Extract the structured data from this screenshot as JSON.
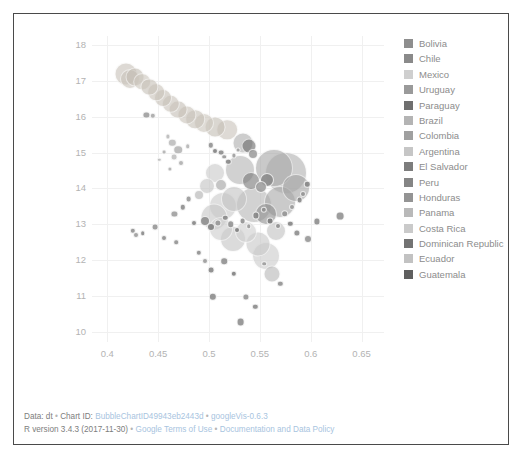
{
  "chart_data": {
    "type": "scatter",
    "title": "",
    "xlabel": "",
    "ylabel": "",
    "xlim": [
      0.385,
      0.672
    ],
    "ylim": [
      9.72,
      18.25
    ],
    "xticks": [
      "0.4",
      "0.45",
      "0.5",
      "0.55",
      "0.6",
      "0.65"
    ],
    "xtick_values": [
      0.4,
      0.45,
      0.5,
      0.55,
      0.6,
      0.65
    ],
    "yticks": [
      "10",
      "11",
      "12",
      "13",
      "14",
      "15",
      "16",
      "17",
      "18"
    ],
    "ytick_values": [
      10,
      11,
      12,
      13,
      14,
      15,
      16,
      17,
      18
    ],
    "grid": true,
    "legend_position": "right",
    "note": "googleVis bubble chart; bubble area encodes a third variable, color encodes country",
    "series": [
      {
        "name": "Bolivia",
        "color": "#8e8e8e"
      },
      {
        "name": "Chile",
        "color": "#8a8a8a"
      },
      {
        "name": "Mexico",
        "color": "#cfcfcf"
      },
      {
        "name": "Uruguay",
        "color": "#9a9a9a"
      },
      {
        "name": "Paraguay",
        "color": "#6f6f6f"
      },
      {
        "name": "Brazil",
        "color": "#b4b4b4"
      },
      {
        "name": "Colombia",
        "color": "#a0a0a0"
      },
      {
        "name": "Argentina",
        "color": "#c6c6c6"
      },
      {
        "name": "El Salvador",
        "color": "#7d7d7d"
      },
      {
        "name": "Peru",
        "color": "#858585"
      },
      {
        "name": "Honduras",
        "color": "#949494"
      },
      {
        "name": "Panama",
        "color": "#b9b9b9"
      },
      {
        "name": "Costa Rica",
        "color": "#cacaca"
      },
      {
        "name": "Dominican Republic",
        "color": "#737373"
      },
      {
        "name": "Ecuador",
        "color": "#c2c2c2"
      },
      {
        "name": "Guatemala",
        "color": "#5f5f5f"
      }
    ],
    "points": [
      {
        "x": 0.4185,
        "y": 17.18,
        "r": 11.5,
        "c": "#c9c3ba"
      },
      {
        "x": 0.4225,
        "y": 17.05,
        "r": 10.0,
        "c": "#cbc5bc"
      },
      {
        "x": 0.4275,
        "y": 17.12,
        "r": 9.5,
        "c": "#c5bfb6"
      },
      {
        "x": 0.4345,
        "y": 16.98,
        "r": 8.8,
        "c": "#cdc7be"
      },
      {
        "x": 0.4415,
        "y": 16.84,
        "r": 8.6,
        "c": "#c8c2b9"
      },
      {
        "x": 0.448,
        "y": 16.69,
        "r": 8.8,
        "c": "#cac4bb"
      },
      {
        "x": 0.455,
        "y": 16.52,
        "r": 9.0,
        "c": "#c7c1b8"
      },
      {
        "x": 0.4625,
        "y": 16.36,
        "r": 9.2,
        "c": "#cbc5bc"
      },
      {
        "x": 0.47,
        "y": 16.2,
        "r": 9.4,
        "c": "#c6c0b7"
      },
      {
        "x": 0.478,
        "y": 16.06,
        "r": 9.6,
        "c": "#cac4bb"
      },
      {
        "x": 0.4865,
        "y": 15.93,
        "r": 9.8,
        "c": "#c8c2b9"
      },
      {
        "x": 0.4955,
        "y": 15.82,
        "r": 10.0,
        "c": "#cdc7be"
      },
      {
        "x": 0.506,
        "y": 15.72,
        "r": 10.4,
        "c": "#c5bfb6"
      },
      {
        "x": 0.518,
        "y": 15.64,
        "r": 10.8,
        "c": "#cbc5bc"
      },
      {
        "x": 0.4385,
        "y": 16.05,
        "r": 3.6,
        "c": "#9c9c9c"
      },
      {
        "x": 0.445,
        "y": 16.02,
        "r": 3.2,
        "c": "#a7a7a7"
      },
      {
        "x": 0.4595,
        "y": 15.45,
        "r": 2.6,
        "c": "#b9b9b9"
      },
      {
        "x": 0.464,
        "y": 15.28,
        "r": 4.2,
        "c": "#bdbdbd"
      },
      {
        "x": 0.47,
        "y": 15.08,
        "r": 4.8,
        "c": "#b5b5b5"
      },
      {
        "x": 0.4655,
        "y": 14.88,
        "r": 3.4,
        "c": "#c0c0c0"
      },
      {
        "x": 0.472,
        "y": 14.7,
        "r": 3.0,
        "c": "#aeaeae"
      },
      {
        "x": 0.479,
        "y": 15.18,
        "r": 2.8,
        "c": "#b3b3b3"
      },
      {
        "x": 0.502,
        "y": 15.2,
        "r": 3.2,
        "c": "#8f8f8f"
      },
      {
        "x": 0.506,
        "y": 15.05,
        "r": 3.0,
        "c": "#7e7e7e"
      },
      {
        "x": 0.5115,
        "y": 15.0,
        "r": 3.4,
        "c": "#8a8a8a"
      },
      {
        "x": 0.515,
        "y": 14.88,
        "r": 2.8,
        "c": "#959595"
      },
      {
        "x": 0.519,
        "y": 14.74,
        "r": 3.2,
        "c": "#848484"
      },
      {
        "x": 0.5245,
        "y": 14.92,
        "r": 2.6,
        "c": "#9b9b9b"
      },
      {
        "x": 0.5285,
        "y": 15.08,
        "r": 2.4,
        "c": "#a2a2a2"
      },
      {
        "x": 0.533,
        "y": 15.26,
        "r": 10.5,
        "c": "#b0b0b0"
      },
      {
        "x": 0.539,
        "y": 15.18,
        "r": 7.5,
        "c": "#6e6e6e"
      },
      {
        "x": 0.543,
        "y": 14.96,
        "r": 5.0,
        "c": "#9e9e9e"
      },
      {
        "x": 0.53,
        "y": 14.52,
        "r": 15.0,
        "c": "#b6b6b6"
      },
      {
        "x": 0.5415,
        "y": 14.2,
        "r": 9.0,
        "c": "#7a7a7a"
      },
      {
        "x": 0.551,
        "y": 14.05,
        "r": 6.0,
        "c": "#9d9d9d"
      },
      {
        "x": 0.557,
        "y": 14.24,
        "r": 7.0,
        "c": "#8b8b8b"
      },
      {
        "x": 0.564,
        "y": 14.58,
        "r": 19.0,
        "c": "#a9a9a9"
      },
      {
        "x": 0.576,
        "y": 14.42,
        "r": 21.0,
        "c": "#b2b2b2"
      },
      {
        "x": 0.5855,
        "y": 14.0,
        "r": 14.0,
        "c": "#a5a5a5"
      },
      {
        "x": 0.544,
        "y": 13.55,
        "r": 18.0,
        "c": "#b8b8b8"
      },
      {
        "x": 0.556,
        "y": 13.28,
        "r": 11.0,
        "c": "#909090"
      },
      {
        "x": 0.57,
        "y": 13.62,
        "r": 16.0,
        "c": "#aaaaaa"
      },
      {
        "x": 0.525,
        "y": 13.72,
        "r": 13.0,
        "c": "#c4c4c4"
      },
      {
        "x": 0.5135,
        "y": 13.52,
        "r": 14.0,
        "c": "#cbcbcb"
      },
      {
        "x": 0.5045,
        "y": 13.2,
        "r": 13.5,
        "c": "#c8c8c8"
      },
      {
        "x": 0.5115,
        "y": 12.88,
        "r": 12.0,
        "c": "#cecece"
      },
      {
        "x": 0.524,
        "y": 12.6,
        "r": 13.0,
        "c": "#c6c6c6"
      },
      {
        "x": 0.536,
        "y": 12.8,
        "r": 11.0,
        "c": "#d0d0d0"
      },
      {
        "x": 0.548,
        "y": 12.45,
        "r": 12.5,
        "c": "#c9c9c9"
      },
      {
        "x": 0.556,
        "y": 12.12,
        "r": 14.0,
        "c": "#cdcdcd"
      },
      {
        "x": 0.566,
        "y": 12.82,
        "r": 10.0,
        "c": "#c3c3c3"
      },
      {
        "x": 0.4965,
        "y": 13.08,
        "r": 5.0,
        "c": "#8d8d8d"
      },
      {
        "x": 0.502,
        "y": 12.92,
        "r": 4.0,
        "c": "#7f7f7f"
      },
      {
        "x": 0.509,
        "y": 13.05,
        "r": 3.6,
        "c": "#979797"
      },
      {
        "x": 0.516,
        "y": 13.18,
        "r": 3.2,
        "c": "#888888"
      },
      {
        "x": 0.5215,
        "y": 13.0,
        "r": 3.8,
        "c": "#929292"
      },
      {
        "x": 0.5275,
        "y": 12.84,
        "r": 3.0,
        "c": "#7c7c7c"
      },
      {
        "x": 0.533,
        "y": 13.1,
        "r": 3.4,
        "c": "#8e8e8e"
      },
      {
        "x": 0.539,
        "y": 12.95,
        "r": 2.8,
        "c": "#999999"
      },
      {
        "x": 0.546,
        "y": 13.25,
        "r": 3.6,
        "c": "#858585"
      },
      {
        "x": 0.554,
        "y": 13.4,
        "r": 3.2,
        "c": "#909090"
      },
      {
        "x": 0.56,
        "y": 13.08,
        "r": 3.4,
        "c": "#7b7b7b"
      },
      {
        "x": 0.568,
        "y": 12.95,
        "r": 3.0,
        "c": "#8c8c8c"
      },
      {
        "x": 0.5745,
        "y": 13.3,
        "r": 3.8,
        "c": "#959595"
      },
      {
        "x": 0.58,
        "y": 13.02,
        "r": 3.2,
        "c": "#818181"
      },
      {
        "x": 0.586,
        "y": 12.75,
        "r": 3.6,
        "c": "#8a8a8a"
      },
      {
        "x": 0.582,
        "y": 13.48,
        "r": 3.0,
        "c": "#9a9a9a"
      },
      {
        "x": 0.589,
        "y": 13.68,
        "r": 3.4,
        "c": "#878787"
      },
      {
        "x": 0.425,
        "y": 12.82,
        "r": 3.2,
        "c": "#8f8f8f"
      },
      {
        "x": 0.4285,
        "y": 12.7,
        "r": 3.0,
        "c": "#9a9a9a"
      },
      {
        "x": 0.435,
        "y": 12.76,
        "r": 2.8,
        "c": "#868686"
      },
      {
        "x": 0.447,
        "y": 12.92,
        "r": 3.4,
        "c": "#939393"
      },
      {
        "x": 0.456,
        "y": 12.62,
        "r": 3.0,
        "c": "#8b8b8b"
      },
      {
        "x": 0.466,
        "y": 13.3,
        "r": 3.6,
        "c": "#9d9d9d"
      },
      {
        "x": 0.4745,
        "y": 13.48,
        "r": 3.2,
        "c": "#8a8a8a"
      },
      {
        "x": 0.48,
        "y": 13.7,
        "r": 3.4,
        "c": "#979797"
      },
      {
        "x": 0.4855,
        "y": 13.05,
        "r": 3.0,
        "c": "#828282"
      },
      {
        "x": 0.468,
        "y": 12.5,
        "r": 2.8,
        "c": "#909090"
      },
      {
        "x": 0.49,
        "y": 12.2,
        "r": 3.2,
        "c": "#8d8d8d"
      },
      {
        "x": 0.496,
        "y": 11.98,
        "r": 3.0,
        "c": "#999999"
      },
      {
        "x": 0.502,
        "y": 11.72,
        "r": 3.4,
        "c": "#858585"
      },
      {
        "x": 0.515,
        "y": 11.98,
        "r": 3.8,
        "c": "#8e8e8e"
      },
      {
        "x": 0.5245,
        "y": 11.62,
        "r": 3.2,
        "c": "#7d7d7d"
      },
      {
        "x": 0.504,
        "y": 10.98,
        "r": 4.2,
        "c": "#8a8a8a"
      },
      {
        "x": 0.536,
        "y": 10.98,
        "r": 3.6,
        "c": "#929292"
      },
      {
        "x": 0.5455,
        "y": 10.7,
        "r": 3.2,
        "c": "#888888"
      },
      {
        "x": 0.531,
        "y": 10.28,
        "r": 4.4,
        "c": "#8d8d8d"
      },
      {
        "x": 0.562,
        "y": 11.62,
        "r": 8.5,
        "c": "#b9b9b9"
      },
      {
        "x": 0.57,
        "y": 11.35,
        "r": 3.2,
        "c": "#8f8f8f"
      },
      {
        "x": 0.5545,
        "y": 11.9,
        "r": 2.8,
        "c": "#9b9b9b"
      },
      {
        "x": 0.597,
        "y": 12.6,
        "r": 4.0,
        "c": "#959595"
      },
      {
        "x": 0.606,
        "y": 13.08,
        "r": 3.6,
        "c": "#8a8a8a"
      },
      {
        "x": 0.629,
        "y": 13.22,
        "r": 4.4,
        "c": "#909090"
      },
      {
        "x": 0.5965,
        "y": 14.12,
        "r": 3.2,
        "c": "#868686"
      },
      {
        "x": 0.592,
        "y": 13.85,
        "r": 3.0,
        "c": "#939393"
      },
      {
        "x": 0.5055,
        "y": 14.42,
        "r": 10.0,
        "c": "#cacaca"
      },
      {
        "x": 0.4985,
        "y": 14.08,
        "r": 8.0,
        "c": "#c4c4c4"
      },
      {
        "x": 0.512,
        "y": 14.1,
        "r": 6.0,
        "c": "#bebebe"
      },
      {
        "x": 0.49,
        "y": 13.82,
        "r": 5.0,
        "c": "#c8c8c8"
      },
      {
        "x": 0.456,
        "y": 15.02,
        "r": 2.4,
        "c": "#b0b0b0"
      },
      {
        "x": 0.451,
        "y": 14.8,
        "r": 2.2,
        "c": "#bababa"
      },
      {
        "x": 0.4615,
        "y": 14.55,
        "r": 2.6,
        "c": "#aeaeae"
      }
    ]
  },
  "legend": {
    "items": [
      {
        "label": "Bolivia",
        "color": "#8e8e8e"
      },
      {
        "label": "Chile",
        "color": "#8a8a8a"
      },
      {
        "label": "Mexico",
        "color": "#cfcfcf"
      },
      {
        "label": "Uruguay",
        "color": "#9a9a9a"
      },
      {
        "label": "Paraguay",
        "color": "#6f6f6f"
      },
      {
        "label": "Brazil",
        "color": "#b4b4b4"
      },
      {
        "label": "Colombia",
        "color": "#a0a0a0"
      },
      {
        "label": "Argentina",
        "color": "#c6c6c6"
      },
      {
        "label": "El Salvador",
        "color": "#7d7d7d"
      },
      {
        "label": "Peru",
        "color": "#858585"
      },
      {
        "label": "Honduras",
        "color": "#949494"
      },
      {
        "label": "Panama",
        "color": "#b9b9b9"
      },
      {
        "label": "Costa Rica",
        "color": "#cacaca"
      },
      {
        "label": "Dominican Republic",
        "color": "#737373"
      },
      {
        "label": "Ecuador",
        "color": "#c2c2c2"
      },
      {
        "label": "Guatemala",
        "color": "#5f5f5f"
      }
    ]
  },
  "footer": {
    "line1": {
      "data_label": "Data: dt",
      "sep1": "•",
      "chart_id_label": "Chart ID:",
      "chart_id": "BubbleChartID49943eb2443d",
      "sep2": "•",
      "library": "googleVis-0.6.3"
    },
    "line2": {
      "r_version": "R version 3.4.3 (2017-11-30)",
      "sep1": "•",
      "terms": "Google Terms of Use",
      "sep2": "•",
      "docs": "Documentation and Data Policy"
    }
  }
}
